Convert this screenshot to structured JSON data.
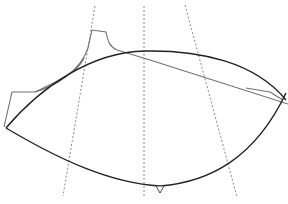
{
  "diagram": {
    "type": "pattern-piece-outline",
    "colors": {
      "background": "#ffffff",
      "primary_outline": "#222222",
      "secondary_outline": "#707070",
      "guide_lines": "#888888"
    },
    "guide_lines": [
      {
        "name": "left-guide",
        "x1": 95,
        "y1": 6,
        "x2": 63,
        "y2": 196
      },
      {
        "name": "center-guide",
        "x1": 144,
        "y1": 6,
        "x2": 144,
        "y2": 197
      },
      {
        "name": "right-guide",
        "x1": 185,
        "y1": 5,
        "x2": 237,
        "y2": 197
      }
    ],
    "primary_outline": {
      "top_curve": "M6,128 C40,85 90,52 145,50 C190,50 250,60 286,100",
      "bottom_curve": "M6,128 C60,160 110,182 160,186 C210,182 250,160 286,93"
    },
    "secondary_outline": {
      "path": "M4,127 L12,92 L35,92 C60,80 85,60 92,30 L106,32 C108,42 112,50 117,50 L288,104 M270,92 L283,100"
    },
    "notch_marker": {
      "x": 160,
      "y": 187
    }
  }
}
